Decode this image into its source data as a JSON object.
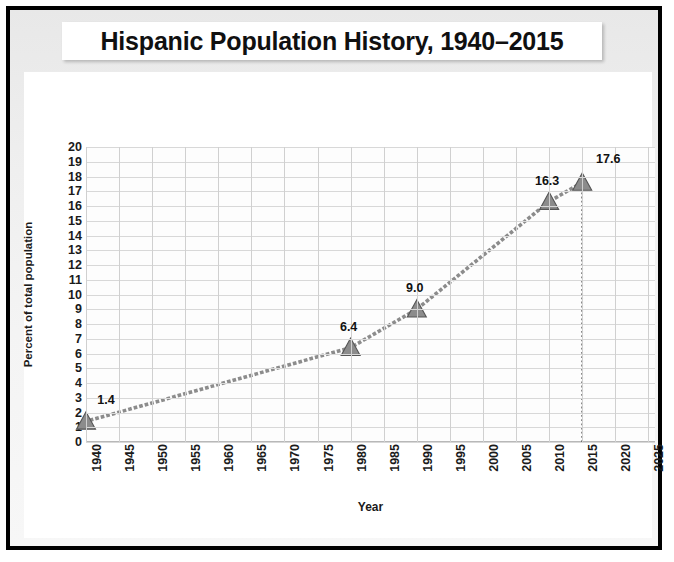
{
  "title": "Hispanic Population History, 1940–2015",
  "chart_data": {
    "type": "line",
    "title": "Hispanic Population History, 1940–2015",
    "xlabel": "Year",
    "ylabel": "Percent of total population",
    "x": [
      1940,
      1980,
      1990,
      2010,
      2015
    ],
    "values": [
      1.4,
      6.4,
      9.0,
      16.3,
      17.6
    ],
    "point_labels": [
      "1.4",
      "6.4",
      "9.0",
      "16.3",
      "17.6"
    ],
    "xlim": [
      1940,
      2026
    ],
    "ylim": [
      0,
      20
    ],
    "xticks": [
      1940,
      1945,
      1950,
      1955,
      1960,
      1965,
      1970,
      1975,
      1980,
      1985,
      1990,
      1995,
      2000,
      2005,
      2010,
      2015,
      2020,
      2025
    ],
    "xtick_labels": [
      "1940",
      "1945",
      "1950",
      "1955",
      "1960",
      "1965",
      "1970",
      "1975",
      "1980",
      "1985",
      "1990",
      "1995",
      "2000",
      "2005",
      "2010",
      "2015",
      "2020",
      "2025"
    ],
    "yticks": [
      0,
      1,
      2,
      3,
      4,
      5,
      6,
      7,
      8,
      9,
      10,
      11,
      12,
      13,
      14,
      15,
      16,
      17,
      18,
      19,
      20
    ],
    "ytick_labels": [
      "0",
      "1",
      "2",
      "3",
      "4",
      "5",
      "6",
      "7",
      "8",
      "9",
      "10",
      "11",
      "12",
      "13",
      "14",
      "15",
      "16",
      "17",
      "18",
      "19",
      "20"
    ],
    "grid": true,
    "legend": false,
    "marker": "triangle",
    "line_style": "dotted",
    "series_color": "#8c8c8c",
    "marker_color": "#8c8c8c",
    "marker_edge_color": "#555555",
    "annotations": [
      {
        "type": "vertical-dotted-line",
        "x": 2015,
        "from_y": 0,
        "to_y": 17.6
      }
    ]
  },
  "colors": {
    "frame": "#000000",
    "slide_background": "#ededed",
    "card_background": "#ffffff",
    "title_text": "#101010",
    "grid": "#d8d8d8",
    "accent": "#8c8c8c"
  }
}
